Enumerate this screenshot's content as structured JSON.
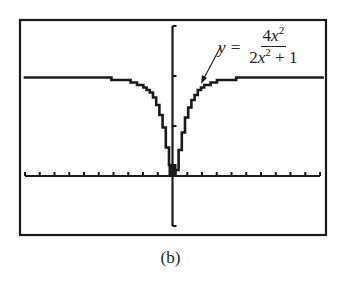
{
  "chart_data": {
    "type": "line",
    "title": "",
    "subtitle": "",
    "caption": "(b)",
    "function": "y = 4x^2 / (2x^2 + 1)",
    "annotation": {
      "lhs": "y =",
      "numerator": "4x",
      "numerator_exp": "2",
      "denominator_a": "2x",
      "denominator_exp": "2",
      "denominator_b": " + 1",
      "arrow_target": "curve, right branch near x≈1.7"
    },
    "xlabel": "",
    "ylabel": "",
    "xlim": [
      -10,
      10
    ],
    "ylim": [
      -1,
      3
    ],
    "x_tick_step": 1,
    "y_tick_step": 1,
    "horizontal_asymptote": 2,
    "grid": false,
    "style": "graphing-calculator pixel plot",
    "x": [
      -10,
      -8,
      -6,
      -4,
      -3,
      -2,
      -1.5,
      -1,
      -0.75,
      -0.5,
      -0.25,
      0,
      0.25,
      0.5,
      0.75,
      1,
      1.5,
      2,
      3,
      4,
      6,
      8,
      10
    ],
    "values": [
      1.99,
      1.98,
      1.97,
      1.94,
      1.89,
      1.78,
      1.64,
      1.33,
      1.06,
      0.67,
      0.22,
      0,
      0.22,
      0.67,
      1.06,
      1.33,
      1.64,
      1.78,
      1.89,
      1.94,
      1.97,
      1.98,
      1.99
    ],
    "colors": {
      "line": "#1a1a1a",
      "axis": "#1a1a1a",
      "frame": "#1a1a1a",
      "background": "#ffffff"
    }
  },
  "caption": "(b)"
}
